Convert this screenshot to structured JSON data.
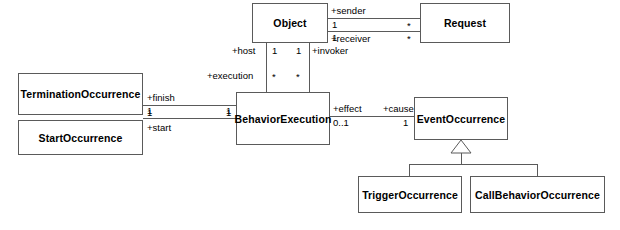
{
  "diagram": {
    "type": "uml-class-diagram",
    "background_color": "#ffffff",
    "line_color": "#5a5a5a",
    "text_color": "#000000",
    "classes": [
      {
        "id": "object",
        "name": "Object"
      },
      {
        "id": "request",
        "name": "Request"
      },
      {
        "id": "termination_occurrence",
        "name": "TerminationOccurrence"
      },
      {
        "id": "start_occurrence",
        "name": "StartOccurrence"
      },
      {
        "id": "behavior_execution",
        "name": "BehaviorExecution"
      },
      {
        "id": "event_occurrence",
        "name": "EventOccurrence"
      },
      {
        "id": "trigger_occurrence",
        "name": "TriggerOccurrence"
      },
      {
        "id": "call_behavior_occurrence",
        "name": "CallBehaviorOccurrence"
      }
    ],
    "associations": [
      {
        "id": "object_request_sender",
        "source": "object",
        "target": "request",
        "source_role": "+sender",
        "source_multiplicity": "1",
        "target_multiplicity": "*"
      },
      {
        "id": "object_request_receiver",
        "source": "object",
        "target": "request",
        "source_role": "+receiver",
        "source_multiplicity": "1",
        "target_multiplicity": "*"
      },
      {
        "id": "object_behaviorexecution_host",
        "source": "object",
        "target": "behavior_execution",
        "source_role": "+host",
        "source_multiplicity": "1",
        "target_role": "+execution",
        "target_multiplicity": "*"
      },
      {
        "id": "object_behaviorexecution_invoker",
        "source": "object",
        "target": "behavior_execution",
        "source_role": "+invoker",
        "source_multiplicity": "1",
        "target_multiplicity": "*"
      },
      {
        "id": "termination_behaviorexecution_finish",
        "source": "termination_occurrence",
        "target": "behavior_execution",
        "source_role": "+finish",
        "source_multiplicity": "1",
        "target_multiplicity": "1"
      },
      {
        "id": "start_behaviorexecution_start",
        "source": "start_occurrence",
        "target": "behavior_execution",
        "source_role": "+start",
        "source_multiplicity": "1",
        "target_multiplicity": "1"
      },
      {
        "id": "behaviorexecution_eventoccurrence_effect_cause",
        "source": "behavior_execution",
        "target": "event_occurrence",
        "source_role": "+effect",
        "source_multiplicity": "0..1",
        "target_role": "+cause",
        "target_multiplicity": "1"
      }
    ],
    "generalizations": [
      {
        "id": "gen_trigger",
        "parent": "event_occurrence",
        "child": "trigger_occurrence"
      },
      {
        "id": "gen_callbehavior",
        "parent": "event_occurrence",
        "child": "call_behavior_occurrence"
      }
    ],
    "labels": {
      "sender": "+sender",
      "receiver": "+receiver",
      "host": "+host",
      "invoker": "+invoker",
      "execution": "+execution",
      "finish": "+finish",
      "start": "+start",
      "effect": "+effect",
      "cause": "+cause"
    },
    "multiplicities": {
      "one": "1",
      "star": "*",
      "zero_or_one": "0..1"
    }
  }
}
